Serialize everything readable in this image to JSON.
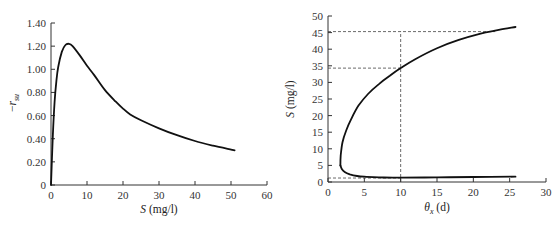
{
  "chart_data": [
    {
      "type": "line",
      "title": "",
      "xlabel": "S (mg/l)",
      "ylabel": "-r_su",
      "xlim": [
        0,
        60
      ],
      "ylim": [
        0,
        1.4
      ],
      "grid": false,
      "legend": null,
      "x_ticks": [
        0,
        10,
        20,
        30,
        40,
        50,
        60
      ],
      "x_tick_labels": [
        "0",
        "10",
        "20",
        "30",
        "40",
        "50",
        "60"
      ],
      "y_ticks": [
        0,
        0.2,
        0.4,
        0.6,
        0.8,
        1.0,
        1.2,
        1.4
      ],
      "y_tick_labels": [
        "0",
        "0.20",
        "0.40",
        "0.60",
        "0.80",
        "1.00",
        "1.20",
        "1.40"
      ],
      "series": [
        {
          "name": "-r_su vs S",
          "x": [
            0,
            0.5,
            1,
            1.5,
            2,
            3,
            4,
            5,
            6,
            8,
            10,
            12,
            15,
            18,
            20,
            22,
            25,
            30,
            35,
            40,
            45,
            51
          ],
          "y": [
            0,
            0.42,
            0.72,
            0.9,
            1.02,
            1.15,
            1.21,
            1.22,
            1.2,
            1.12,
            1.03,
            0.95,
            0.82,
            0.72,
            0.66,
            0.61,
            0.56,
            0.49,
            0.43,
            0.38,
            0.34,
            0.3
          ]
        }
      ]
    },
    {
      "type": "line",
      "title": "",
      "xlabel": "θx (d)",
      "ylabel": "S (mg/l)",
      "xlim": [
        0,
        30
      ],
      "ylim": [
        0,
        50
      ],
      "grid": false,
      "legend": null,
      "x_ticks": [
        0,
        5,
        10,
        15,
        20,
        25,
        30
      ],
      "x_tick_labels": [
        "0",
        "5",
        "10",
        "15",
        "20",
        "25",
        "30"
      ],
      "y_ticks": [
        0,
        5,
        10,
        15,
        20,
        25,
        30,
        35,
        40,
        45,
        50
      ],
      "y_tick_labels": [
        "0",
        "5",
        "10",
        "15",
        "20",
        "25",
        "30",
        "35",
        "40",
        "45",
        "50"
      ],
      "series": [
        {
          "name": "S vs θx (upper branch)",
          "x": [
            1.7,
            1.75,
            2.0,
            2.5,
            3.2,
            4.2,
            5.5,
            7.0,
            8.5,
            10,
            12,
            15,
            18,
            21,
            23.5,
            25.8
          ],
          "y": [
            5,
            8,
            12,
            15.5,
            19,
            23,
            26.5,
            29.5,
            32,
            34.3,
            37,
            40.3,
            42.8,
            44.7,
            45.8,
            46.7
          ]
        },
        {
          "name": "S vs θx (lower branch)",
          "x": [
            1.7,
            1.9,
            2.3,
            3.0,
            4.0,
            5.0,
            7.0,
            10,
            15,
            20,
            25.8
          ],
          "y": [
            5,
            3.9,
            3.0,
            2.3,
            1.8,
            1.6,
            1.4,
            1.3,
            1.4,
            1.5,
            1.6
          ]
        }
      ],
      "annotations": [
        {
          "type": "vline-dashed",
          "x": 10,
          "from_y": 0,
          "to_y": 45.3
        },
        {
          "type": "hline-dashed",
          "y": 45.3,
          "from_x": 0,
          "to_x": 23
        },
        {
          "type": "hline-dashed",
          "y": 34.3,
          "from_x": 0,
          "to_x": 10
        },
        {
          "type": "hline-dashed",
          "y": 1.2,
          "from_x": 0,
          "to_x": 10
        }
      ]
    }
  ],
  "labels": {
    "left": {
      "xlabel_var": "S",
      "xlabel_unit": " (mg/l)",
      "ylabel_sign": "−",
      "ylabel_var": "r",
      "ylabel_sub": "su"
    },
    "right": {
      "xlabel_var": "θ",
      "xlabel_sub": "x",
      "xlabel_unit": " (d)",
      "ylabel_var": "S",
      "ylabel_unit": " (mg/l)"
    }
  }
}
